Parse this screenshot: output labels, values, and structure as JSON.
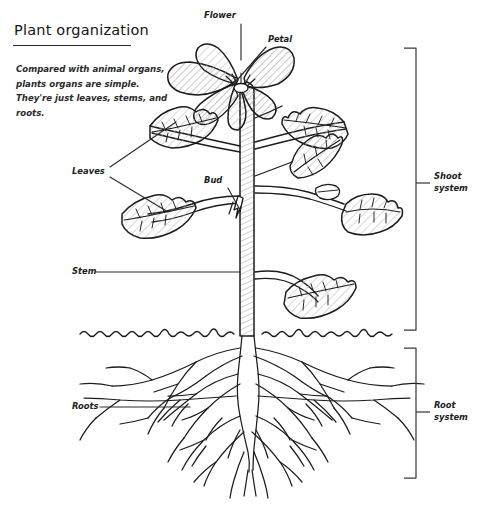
{
  "page": {
    "title": "Plant organization",
    "body_text": "Compared with animal organs, plants organs are simple. They're just leaves, stems, and roots.",
    "background_color": "#ffffff",
    "ink_color": "#1c1c1c"
  },
  "labels": {
    "flower": "Flower",
    "petal": "Petal",
    "leaves": "Leaves",
    "bud": "Bud",
    "stem": "Stem",
    "roots": "Roots"
  },
  "systems": {
    "shoot_line1": "Shoot",
    "shoot_line2": "system",
    "root_line1": "Root",
    "root_line2": "system"
  },
  "illustration": {
    "name": "plant-anatomy-line-drawing",
    "style": "hand-drawn hatched botanical sketch",
    "parts": [
      "flower",
      "petal",
      "leaves",
      "bud",
      "stem",
      "soil-line",
      "roots"
    ]
  }
}
